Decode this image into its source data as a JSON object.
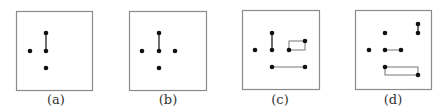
{
  "colors": {
    "frame": "#8a8a8a",
    "dot": "#111111",
    "edge_dark": "#333333",
    "edge_light": "#777777"
  },
  "panels": [
    {
      "label": "(a)",
      "label_x": 56,
      "frame": [
        16,
        11,
        76,
        79
      ],
      "dots": [
        [
          46,
          33
        ],
        [
          30,
          51
        ],
        [
          46,
          51
        ],
        [
          46,
          68
        ]
      ],
      "edges": [
        [
          [
            46,
            33
          ],
          [
            46,
            51
          ]
        ]
      ],
      "rects": []
    },
    {
      "label": "(b)",
      "label_x": 168,
      "frame": [
        129,
        11,
        77,
        79
      ],
      "dots": [
        [
          159,
          33
        ],
        [
          142,
          51
        ],
        [
          159,
          51
        ],
        [
          175,
          51
        ],
        [
          159,
          68
        ]
      ],
      "edges": [
        [
          [
            159,
            33
          ],
          [
            159,
            51
          ]
        ]
      ],
      "rects": []
    },
    {
      "label": "(c)",
      "label_x": 280,
      "frame": [
        242,
        10,
        77,
        79
      ],
      "dots": [
        [
          272,
          33
        ],
        [
          255,
          50
        ],
        [
          272,
          50
        ],
        [
          289,
          50
        ],
        [
          305,
          41
        ],
        [
          272,
          67
        ],
        [
          305,
          67
        ]
      ],
      "edges": [
        [
          [
            272,
            33
          ],
          [
            272,
            50
          ]
        ],
        [
          [
            272,
            67
          ],
          [
            305,
            67
          ]
        ]
      ],
      "rects": [
        [
          289,
          41,
          16,
          9
        ]
      ]
    },
    {
      "label": "(d)",
      "label_x": 393,
      "frame": [
        355,
        10,
        76,
        79
      ],
      "dots": [
        [
          418,
          24
        ],
        [
          418,
          33
        ],
        [
          385,
          33
        ],
        [
          369,
          50
        ],
        [
          385,
          50
        ],
        [
          401,
          50
        ],
        [
          385,
          67
        ],
        [
          418,
          75
        ]
      ],
      "edges": [
        [
          [
            418,
            24
          ],
          [
            418,
            33
          ]
        ],
        [
          [
            385,
            50
          ],
          [
            401,
            50
          ]
        ]
      ],
      "rects": [
        [
          385,
          67,
          33,
          8
        ]
      ]
    }
  ]
}
